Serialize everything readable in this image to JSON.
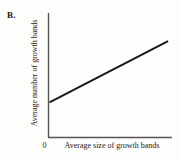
{
  "figure": {
    "panel_label": "B.",
    "background_color": "#fdfdfc",
    "ink_color": "#1a1a1a"
  },
  "chart_data": {
    "type": "line",
    "title": "",
    "subtitle": "",
    "xlabel": "Average size of growth bands",
    "ylabel": "Average number of growth bands",
    "origin_tick_label": "0",
    "xticks": [
      "0"
    ],
    "yticks": [],
    "grid": false,
    "legend": null,
    "xlim": [
      0,
      1
    ],
    "ylim": [
      0,
      1
    ],
    "annotations": [],
    "series": [
      {
        "name": "positive linear trend",
        "x": [
          0.008,
          0.968
        ],
        "y": [
          0.282,
          0.774
        ],
        "line_color": "#1a1a1a",
        "line_width": 2,
        "markers": false
      }
    ]
  },
  "axes": {
    "y_axis_color": "#555555",
    "x_axis_color": "#555555",
    "y_axis_width": 1,
    "x_axis_width": 1
  }
}
